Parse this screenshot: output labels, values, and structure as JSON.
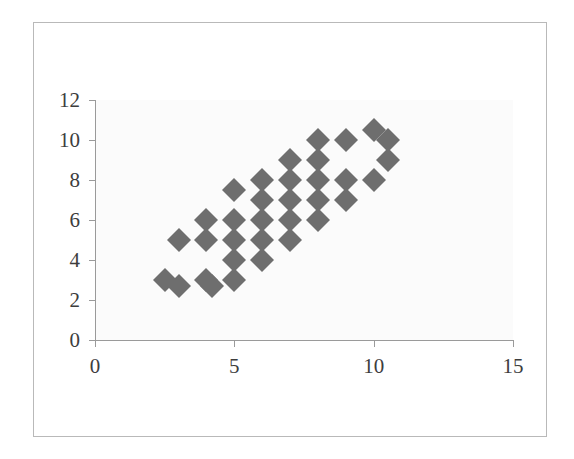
{
  "chart_data": {
    "type": "scatter",
    "title": "",
    "xlabel": "",
    "ylabel": "",
    "xlim": [
      0,
      15
    ],
    "ylim": [
      0,
      12
    ],
    "xticks": [
      0,
      5,
      10,
      15
    ],
    "yticks": [
      0,
      2,
      4,
      6,
      8,
      10,
      12
    ],
    "xtick_labels": [
      "0",
      "5",
      "10",
      "15"
    ],
    "ytick_labels": [
      "0",
      "2",
      "4",
      "6",
      "8",
      "10",
      "12"
    ],
    "grid": false,
    "legend": false,
    "marker": "diamond",
    "marker_color": "#6e6e6e",
    "plot_background": "#fbfbfb",
    "frame_color": "#b9b9b9",
    "axis_color": "#9a9a9a",
    "series": [
      {
        "name": "Series 1",
        "points": [
          [
            2.5,
            3.0
          ],
          [
            3.0,
            2.7
          ],
          [
            3.0,
            5.0
          ],
          [
            4.0,
            3.0
          ],
          [
            4.2,
            2.7
          ],
          [
            4.0,
            5.0
          ],
          [
            4.0,
            6.0
          ],
          [
            5.0,
            3.0
          ],
          [
            5.0,
            4.0
          ],
          [
            5.0,
            5.0
          ],
          [
            5.0,
            6.0
          ],
          [
            5.0,
            7.5
          ],
          [
            6.0,
            4.0
          ],
          [
            6.0,
            5.0
          ],
          [
            6.0,
            6.0
          ],
          [
            6.0,
            7.0
          ],
          [
            6.0,
            8.0
          ],
          [
            7.0,
            5.0
          ],
          [
            7.0,
            6.0
          ],
          [
            7.0,
            7.0
          ],
          [
            7.0,
            8.0
          ],
          [
            7.0,
            9.0
          ],
          [
            8.0,
            6.0
          ],
          [
            8.0,
            7.0
          ],
          [
            8.0,
            8.0
          ],
          [
            8.0,
            9.0
          ],
          [
            8.0,
            10.0
          ],
          [
            9.0,
            7.0
          ],
          [
            9.0,
            8.0
          ],
          [
            9.0,
            10.0
          ],
          [
            10.0,
            8.0
          ],
          [
            10.0,
            10.5
          ],
          [
            10.5,
            10.0
          ],
          [
            10.5,
            9.0
          ]
        ]
      }
    ]
  }
}
